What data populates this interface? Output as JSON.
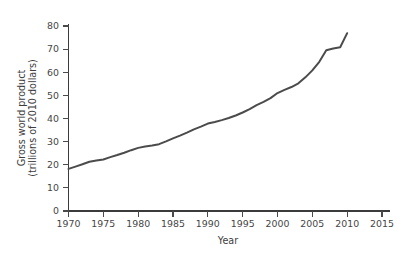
{
  "chart_data": {
    "type": "line",
    "title": "",
    "xlabel": "Year",
    "ylabel": "Gross world product\n(trillions of 2010 dollars)",
    "ylabel_line1": "Gross world product",
    "ylabel_line2": "(trillions of 2010 dollars)",
    "xlim": [
      1970,
      2015
    ],
    "ylim": [
      0,
      80
    ],
    "xticks": [
      1970,
      1975,
      1980,
      1985,
      1990,
      1995,
      2000,
      2005,
      2010,
      2015
    ],
    "yticks": [
      0,
      10,
      20,
      30,
      40,
      50,
      60,
      70,
      80
    ],
    "xtick_labels": [
      "1970",
      "1975",
      "1980",
      "1985",
      "1990",
      "1995",
      "2000",
      "2005",
      "2010",
      "2015"
    ],
    "ytick_labels": [
      "0",
      "10",
      "20",
      "30",
      "40",
      "50",
      "60",
      "70",
      "80"
    ],
    "grid": false,
    "legend": false,
    "legend_position": "none",
    "line_color": "#4b4b4b",
    "series": [
      {
        "name": "Gross world product",
        "x": [
          1970,
          1971,
          1972,
          1973,
          1974,
          1975,
          1976,
          1977,
          1978,
          1979,
          1980,
          1981,
          1982,
          1983,
          1984,
          1985,
          1986,
          1987,
          1988,
          1989,
          1990,
          1991,
          1992,
          1993,
          1994,
          1995,
          1996,
          1997,
          1998,
          1999,
          2000,
          2001,
          2002,
          2003,
          2004,
          2005,
          2006,
          2007,
          2008,
          2009,
          2010
        ],
        "values": [
          18.2,
          19.2,
          20.2,
          21.3,
          21.8,
          22.3,
          23.3,
          24.2,
          25.2,
          26.3,
          27.3,
          27.9,
          28.3,
          28.9,
          30.1,
          31.4,
          32.6,
          33.9,
          35.3,
          36.5,
          37.8,
          38.5,
          39.3,
          40.2,
          41.3,
          42.6,
          44.1,
          45.8,
          47.2,
          48.8,
          51.0,
          52.4,
          53.6,
          55.2,
          57.8,
          60.8,
          64.5,
          69.5,
          70.3,
          70.8,
          76.9
        ]
      }
    ]
  },
  "axis": {
    "x_title": "Year",
    "y_title_line1": "Gross world product",
    "y_title_line2": "(trillions of 2010 dollars)"
  }
}
